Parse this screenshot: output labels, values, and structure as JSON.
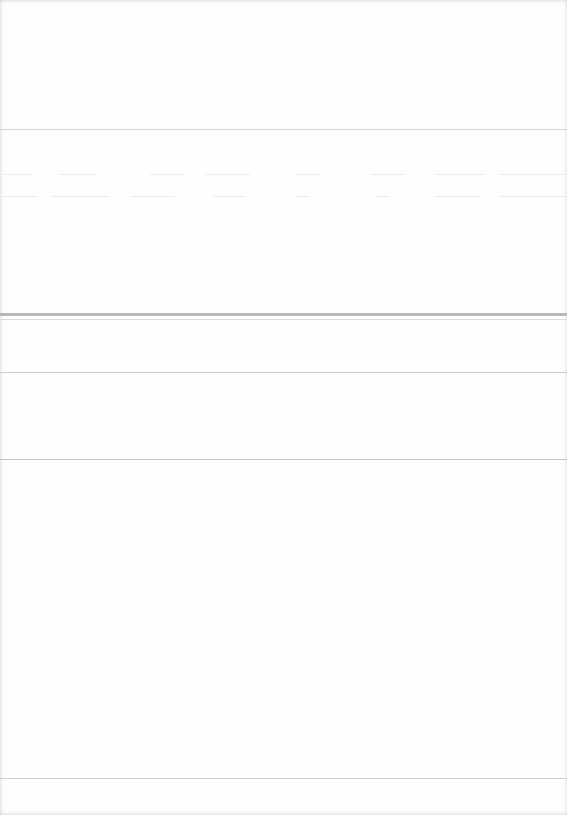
{
  "document": {
    "type": "blank scanned page",
    "text": "",
    "colors": {
      "paper": "#fefefe",
      "rule_light": "#d6d6d6",
      "rule_dark": "#b8b8b8",
      "bleed_through": "#ececec"
    },
    "rules": [
      {
        "y": 129,
        "weight": "thin",
        "color": "#d4d4d4"
      },
      {
        "y": 313,
        "weight": "thick",
        "color": "#b8b8b8"
      },
      {
        "y": 319,
        "weight": "thin",
        "color": "#dddddd"
      },
      {
        "y": 372,
        "weight": "thin",
        "color": "#cccccc"
      },
      {
        "y": 459,
        "weight": "thin",
        "color": "#c4c4c4"
      },
      {
        "y": 778,
        "weight": "thin",
        "color": "#d0d0d0"
      }
    ],
    "bleed_through_rows": [
      {
        "y": 174,
        "dashes": [
          [
            0,
            32
          ],
          [
            60,
            95
          ],
          [
            150,
            185
          ],
          [
            205,
            250
          ],
          [
            295,
            320
          ],
          [
            370,
            405
          ],
          [
            435,
            485
          ],
          [
            500,
            567
          ]
        ]
      },
      {
        "y": 196,
        "dashes": [
          [
            0,
            38
          ],
          [
            52,
            110
          ],
          [
            130,
            175
          ],
          [
            213,
            245
          ],
          [
            295,
            310
          ],
          [
            375,
            390
          ],
          [
            435,
            480
          ],
          [
            500,
            567
          ]
        ]
      }
    ]
  }
}
